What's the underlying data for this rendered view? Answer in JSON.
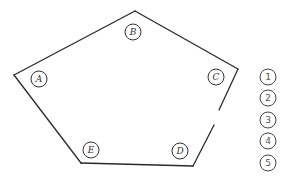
{
  "diagram": {
    "polygon": {
      "vertices": [
        [
          14,
          75
        ],
        [
          135,
          11
        ],
        [
          238,
          69
        ],
        [
          193,
          166
        ],
        [
          81,
          163
        ]
      ],
      "gap_on_edge": {
        "from": [
          219,
          110
        ],
        "to": [
          214,
          125
        ]
      }
    },
    "nodes": [
      {
        "id": "A",
        "label": "A",
        "cx": 39,
        "cy": 79
      },
      {
        "id": "B",
        "label": "B",
        "cx": 133,
        "cy": 32
      },
      {
        "id": "C",
        "label": "C",
        "cx": 216,
        "cy": 77
      },
      {
        "id": "D",
        "label": "D",
        "cx": 180,
        "cy": 151
      },
      {
        "id": "E",
        "label": "E",
        "cx": 91,
        "cy": 150
      }
    ],
    "numbered_slots": [
      {
        "label": "1",
        "cx": 268,
        "cy": 77
      },
      {
        "label": "2",
        "cx": 268,
        "cy": 98
      },
      {
        "label": "3",
        "cx": 268,
        "cy": 120
      },
      {
        "label": "4",
        "cx": 268,
        "cy": 141
      },
      {
        "label": "5",
        "cx": 268,
        "cy": 163
      }
    ],
    "colors": {
      "line": "#2a2a2a",
      "background": "#ffffff"
    }
  }
}
